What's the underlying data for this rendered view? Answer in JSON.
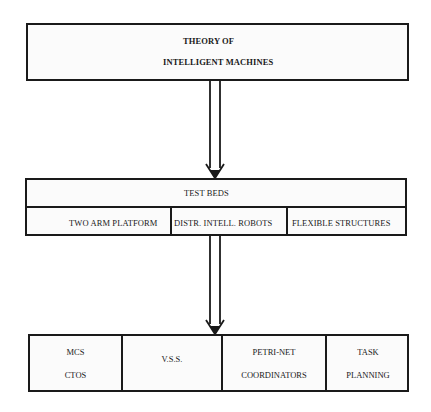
{
  "top_box": {
    "line1": "THEORY OF",
    "line2": "INTELLIGENT MACHINES"
  },
  "test_beds": {
    "title": "TEST  BEDS",
    "items": [
      "TWO ARM PLATFORM",
      "DISTR. INTELL. ROBOTS",
      "FLEXIBLE STRUCTURES"
    ]
  },
  "bottom_box": {
    "cells": [
      {
        "line1": "MCS",
        "line2": "CTOS"
      },
      {
        "line1": "V.S.S.",
        "line2": ""
      },
      {
        "line1": "PETRI-NET",
        "line2": "COORDINATORS"
      },
      {
        "line1": "TASK",
        "line2": "PLANNING"
      }
    ]
  },
  "colors": {
    "stroke": "#1a1a1a",
    "background": "#ffffff"
  }
}
